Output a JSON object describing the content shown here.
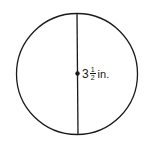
{
  "figure": {
    "shape": "circle",
    "segment": "diameter",
    "center_point": true,
    "measurement": {
      "whole": "3",
      "numerator": "1",
      "denominator": "2",
      "unit": "in."
    },
    "colors": {
      "stroke": "#1a1a1a",
      "background": "#ffffff"
    }
  }
}
